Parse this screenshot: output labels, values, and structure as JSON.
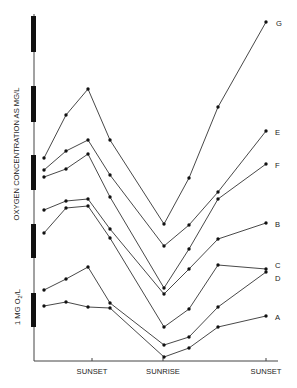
{
  "chart_data": {
    "type": "line",
    "title": "",
    "xlabel": "",
    "ylabel": "OXYGEN CONCENTRATION AS MG/L",
    "scale_label": "1 MG O2/L",
    "x_tick_labels": [
      "SUNSET",
      "SUNRISE",
      "SUNSET"
    ],
    "x_tick_positions": [
      92,
      163,
      266
    ],
    "grid": false,
    "legend_position": "right-end-labels",
    "y_scale_bars_px": [
      [
        16,
        52
      ],
      [
        86,
        122
      ],
      [
        155,
        190
      ],
      [
        224,
        258
      ],
      [
        293,
        327
      ]
    ],
    "x_px": [
      44,
      66,
      88,
      110,
      164,
      189,
      218,
      266
    ],
    "series": [
      {
        "name": "G",
        "y_px": [
          158,
          115,
          89,
          140,
          224,
          178,
          107,
          22
        ],
        "label_xy": [
          276,
          26
        ]
      },
      {
        "name": "E",
        "y_px": [
          170,
          151,
          140,
          175,
          246,
          225,
          192,
          131
        ],
        "label_xy": [
          275,
          135
        ]
      },
      {
        "name": "F",
        "y_px": [
          177,
          169,
          154,
          197,
          288,
          249,
          199,
          164
        ],
        "label_xy": [
          275,
          168
        ]
      },
      {
        "name": "B",
        "y_px": [
          210,
          201,
          199,
          229,
          294,
          269,
          239,
          223
        ],
        "label_xy": [
          275,
          227
        ]
      },
      {
        "name": "C",
        "y_px": [
          233,
          208,
          206,
          238,
          327,
          309,
          265,
          269
        ],
        "label_xy": [
          275,
          268
        ]
      },
      {
        "name": "D",
        "y_px": [
          290,
          279,
          267,
          303,
          345,
          337,
          307,
          272
        ],
        "label_xy": [
          275,
          281
        ]
      },
      {
        "name": "A",
        "y_px": [
          306,
          302,
          307,
          308,
          357,
          348,
          327,
          316
        ],
        "label_xy": [
          275,
          320
        ]
      }
    ],
    "values_mg_per_l_approx": {
      "note": "1 scale bar (~34.5px) = 1 MG O2/L; values relative to x-axis baseline (y=361)",
      "G": [
        5.9,
        7.1,
        7.9,
        6.4,
        4.0,
        5.3,
        7.4,
        9.8
      ],
      "E": [
        5.5,
        6.1,
        6.4,
        5.4,
        3.3,
        3.9,
        4.9,
        6.6
      ],
      "F": [
        5.3,
        5.6,
        6.0,
        4.8,
        2.1,
        3.2,
        4.7,
        5.7
      ],
      "B": [
        4.4,
        4.6,
        4.7,
        3.8,
        1.9,
        2.7,
        3.5,
        4.0
      ],
      "C": [
        3.7,
        4.4,
        4.5,
        3.6,
        1.0,
        1.5,
        2.8,
        2.7
      ],
      "D": [
        2.1,
        2.4,
        2.7,
        1.7,
        0.5,
        0.7,
        1.6,
        2.6
      ],
      "A": [
        1.6,
        1.7,
        1.6,
        1.5,
        0.1,
        0.4,
        1.0,
        1.3
      ]
    }
  }
}
